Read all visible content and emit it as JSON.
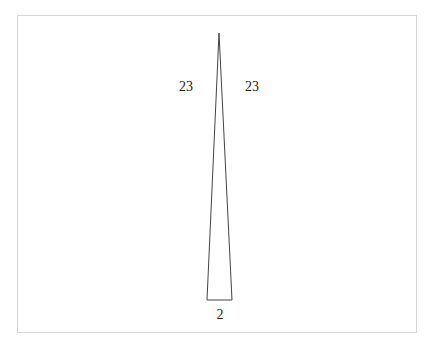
{
  "diagram": {
    "type": "isosceles-triangle",
    "stroke_color": "#444444",
    "border_color": "#d6d6d6",
    "vertices": {
      "apex": [
        219,
        33
      ],
      "base_left": [
        207,
        300
      ],
      "base_right": [
        232,
        300
      ]
    },
    "labels": {
      "left_side": "23",
      "right_side": "23",
      "base": "2"
    }
  }
}
